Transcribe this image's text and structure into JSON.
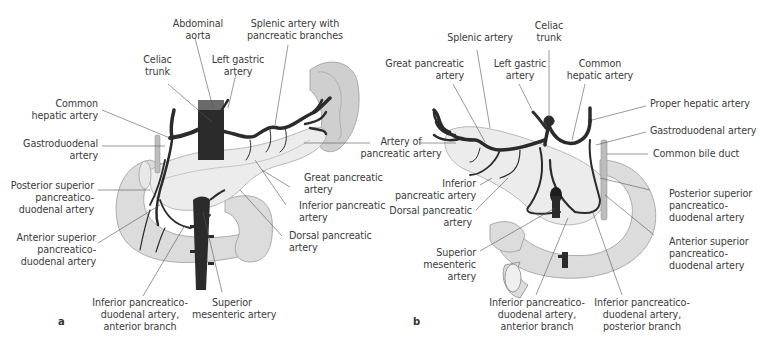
{
  "figure": {
    "colors": {
      "artery": "#2b2b2b",
      "pancreas": "#ececec",
      "duodenum": "#dcdcdc",
      "spleen": "#cfcfcf",
      "leader_line": "#555555",
      "label_text": "#3b3b3b"
    },
    "panel_a": {
      "letter": "a",
      "labels": {
        "abdominal_aorta": [
          "Abdominal",
          "aorta"
        ],
        "splenic_artery_branches": [
          "Splenic artery with",
          "pancreatic branches"
        ],
        "celiac_trunk": [
          "Celiac",
          "trunk"
        ],
        "left_gastric": [
          "Left gastric",
          "artery"
        ],
        "common_hepatic": [
          "Common",
          "hepatic artery"
        ],
        "gastroduodenal": [
          "Gastroduodenal",
          "artery"
        ],
        "posterior_superior_pd": [
          "Posterior superior",
          "pancreatico-",
          "duodenal artery"
        ],
        "anterior_superior_pd": [
          "Anterior superior",
          "pancreatico-",
          "duodenal artery"
        ],
        "inferior_pd_anterior": [
          "Inferior pancreatico-",
          "duodenal artery,",
          "anterior branch"
        ],
        "superior_mesenteric": [
          "Superior",
          "mesenteric artery"
        ],
        "great_pancreatic": [
          "Great pancreatic",
          "artery"
        ],
        "inferior_pancreatic": [
          "Inferior pancreatic",
          "artery"
        ],
        "dorsal_pancreatic": [
          "Dorsal pancreatic",
          "artery"
        ]
      }
    },
    "shared": {
      "artery_of_pancreatic_tail": [
        "Artery of",
        "pancreatic artery"
      ]
    },
    "panel_b": {
      "letter": "b",
      "labels": {
        "splenic_artery": [
          "Splenic artery"
        ],
        "celiac_trunk": [
          "Celiac",
          "trunk"
        ],
        "great_pancreatic": [
          "Great pancreatic",
          "artery"
        ],
        "left_gastric": [
          "Left gastric",
          "artery"
        ],
        "common_hepatic": [
          "Common",
          "hepatic artery"
        ],
        "proper_hepatic": [
          "Proper hepatic artery"
        ],
        "gastroduodenal": [
          "Gastroduodenal artery"
        ],
        "common_bile_duct": [
          "Common bile duct"
        ],
        "inferior_pancreatic": [
          "Inferior",
          "pancreatic artery"
        ],
        "dorsal_pancreatic": [
          "Dorsal pancreatic",
          "artery"
        ],
        "superior_mesenteric": [
          "Superior",
          "mesenteric",
          "artery"
        ],
        "posterior_superior_pd": [
          "Posterior superior",
          "pancreatico-",
          "duodenal artery"
        ],
        "anterior_superior_pd": [
          "Anterior superior",
          "pancreatico-",
          "duodenal artery"
        ],
        "inferior_pd_anterior": [
          "Inferior pancreatico-",
          "duodenal artery,",
          "anterior branch"
        ],
        "inferior_pd_posterior": [
          "Inferior pancreatico-",
          "duodenal artery,",
          "posterior branch"
        ]
      }
    }
  }
}
